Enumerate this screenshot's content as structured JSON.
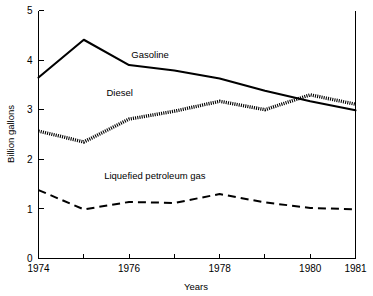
{
  "chart_data": {
    "type": "line",
    "title": "",
    "xlabel": "Years",
    "ylabel": "Billion gallons",
    "xlim": [
      1974,
      1981
    ],
    "ylim": [
      0,
      5
    ],
    "grid": false,
    "legend": "inline-annotations",
    "x": [
      1974,
      1975,
      1976,
      1977,
      1978,
      1979,
      1980,
      1981
    ],
    "xticks": [
      1974,
      1975,
      1976,
      1977,
      1978,
      1979,
      1980,
      1981
    ],
    "xtick_labels": [
      "1974",
      "",
      "1976",
      "",
      "1978",
      "",
      "1980",
      "1981"
    ],
    "yticks": [
      0,
      1,
      2,
      3,
      4,
      5
    ],
    "ytick_labels": [
      "0",
      "1",
      "2",
      "3",
      "4",
      "5"
    ],
    "series": [
      {
        "name": "Gasoline",
        "style": "solid",
        "values": [
          3.65,
          4.41,
          3.9,
          3.79,
          3.63,
          3.38,
          3.17,
          2.99
        ],
        "label_x": 1976.05,
        "label_y": 4.05
      },
      {
        "name": "Diesel",
        "style": "dotted",
        "values": [
          2.57,
          2.35,
          2.81,
          2.97,
          3.17,
          3.0,
          3.3,
          3.11
        ],
        "label_x": 1975.5,
        "label_y": 3.27
      },
      {
        "name": "Liquefied petroleum gas",
        "style": "dashed",
        "values": [
          1.38,
          0.99,
          1.14,
          1.12,
          1.3,
          1.13,
          1.02,
          0.99
        ],
        "label_x": 1975.45,
        "label_y": 1.6
      }
    ]
  },
  "axes": {
    "y_axis_title": "Billion gallons",
    "x_axis_title": "Years"
  }
}
